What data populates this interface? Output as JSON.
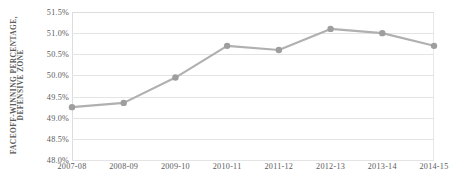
{
  "chart_data": {
    "type": "line",
    "title": "",
    "subtitle": "",
    "xlabel": "",
    "ylabel": "FACEOFF-WINNING PERCENTAGE, DEFENSIVE ZONE",
    "ylabel_lines": [
      "FACEOFF-WINNING PERCENTAGE,",
      "DEFENSIVE ZONE"
    ],
    "categories": [
      "2007-08",
      "2008-09",
      "2009-10",
      "2010-11",
      "2011-12",
      "2012-13",
      "2013-14",
      "2014-15"
    ],
    "values": [
      49.25,
      49.35,
      49.95,
      50.7,
      50.6,
      51.1,
      51.0,
      50.7
    ],
    "value_labels": [
      "49.25%",
      "49.35%",
      "49.95%",
      "50.7%",
      "50.6%",
      "51.1%",
      "51.0%",
      "50.7%"
    ],
    "ylim": [
      48.0,
      51.5
    ],
    "ytick_values": [
      51.5,
      51.0,
      50.5,
      50.0,
      49.5,
      49.0,
      48.5,
      48.0
    ],
    "ytick_labels": [
      "51.5%",
      "51.0%",
      "50.5%",
      "50.0%",
      "49.5%",
      "49.0%",
      "48.5%",
      "48.0%"
    ],
    "grid": true,
    "grid_axis": "y",
    "legend": false,
    "legend_position": "none",
    "series": [
      {
        "name": "Faceoff-winning percentage, defensive zone",
        "values": [
          49.25,
          49.35,
          49.95,
          50.7,
          50.6,
          51.1,
          51.0,
          50.7
        ],
        "line_color": "#b0b0b0",
        "marker_color": "#9e9e9e",
        "marker": "circle"
      }
    ]
  },
  "style": {
    "background_color": "#ffffff",
    "grid_color": "#e4e4e4",
    "axis_color": "#dcdcdc",
    "text_color": "#5c5c5c",
    "line_color": "#b0b0b0",
    "marker_color": "#9e9e9e"
  }
}
